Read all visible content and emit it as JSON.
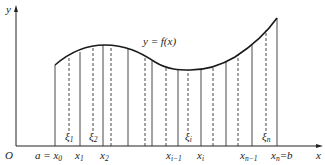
{
  "figure": {
    "curve_label": "y = f(x)",
    "axes": {
      "x_label": "x",
      "y_label": "y",
      "origin_label": "O"
    },
    "partition_labels": [
      {
        "base": "a = x",
        "sub": "0"
      },
      {
        "base": "x",
        "sub": "1"
      },
      {
        "base": "x",
        "sub": "2"
      },
      {
        "base": "x",
        "sub": "i−1"
      },
      {
        "base": "x",
        "sub": "i"
      },
      {
        "base": "x",
        "sub": "n−1"
      },
      {
        "base": "x",
        "sub": "n",
        "suffix": "=b"
      }
    ],
    "sample_labels": [
      {
        "base": "ξ",
        "sub": "1"
      },
      {
        "base": "ξ",
        "sub": "2"
      },
      {
        "base": "ξ",
        "sub": "i"
      },
      {
        "base": "ξ",
        "sub": "n"
      }
    ],
    "colors": {
      "line": "#222222",
      "curve": "#1a1a1a",
      "background": "#ffffff"
    }
  }
}
